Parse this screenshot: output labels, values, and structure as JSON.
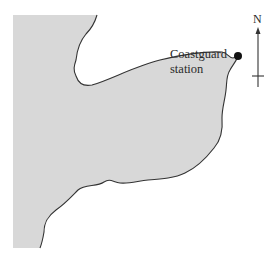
{
  "diagram": {
    "type": "map-sketch",
    "labels": {
      "station_line1": "Coastguard",
      "station_line2": "station",
      "north": "N"
    },
    "colors": {
      "land": "#d8d8d8",
      "coastline": "#333333",
      "marker": "#111111",
      "compass": "#333333",
      "background": "#ffffff"
    },
    "features": [
      {
        "name": "land-mass",
        "kind": "shaded-region"
      },
      {
        "name": "coastline",
        "kind": "path"
      },
      {
        "name": "coastguard-station",
        "kind": "point-marker"
      },
      {
        "name": "north-arrow",
        "kind": "compass"
      }
    ]
  }
}
